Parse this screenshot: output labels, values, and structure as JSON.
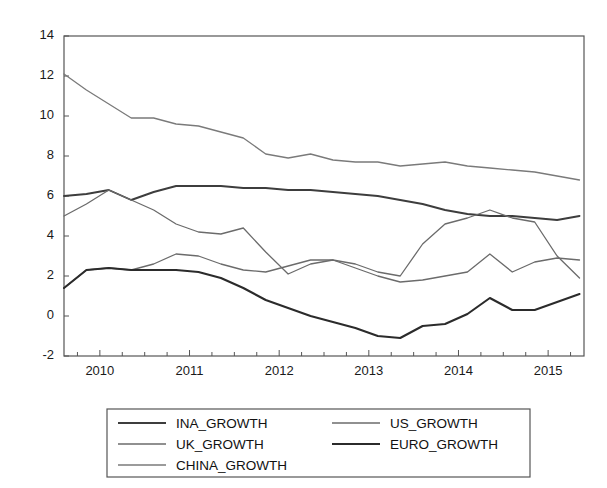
{
  "chart_data": {
    "type": "line",
    "title": "",
    "xlabel": "",
    "ylabel": "",
    "xlim": [
      2009.6,
      2015.4
    ],
    "ylim": [
      -2,
      14
    ],
    "yticks": [
      -2,
      0,
      2,
      4,
      6,
      8,
      10,
      12,
      14
    ],
    "xticks": [
      2010,
      2011,
      2012,
      2013,
      2014,
      2015
    ],
    "x_minor_tick_interval": 0.25,
    "grid": false,
    "legend_position": "below-center",
    "x": [
      2009.6,
      2009.85,
      2010.1,
      2010.35,
      2010.6,
      2010.85,
      2011.1,
      2011.35,
      2011.6,
      2011.85,
      2012.1,
      2012.35,
      2012.6,
      2012.85,
      2013.1,
      2013.35,
      2013.6,
      2013.85,
      2014.1,
      2014.35,
      2014.6,
      2014.85,
      2015.1,
      2015.35
    ],
    "series": [
      {
        "name": "INA_GROWTH",
        "color": "#3d3d3d",
        "width": 1.9,
        "values": [
          6.0,
          6.1,
          6.3,
          5.8,
          6.2,
          6.5,
          6.5,
          6.5,
          6.4,
          6.4,
          6.3,
          6.3,
          6.2,
          6.1,
          6.0,
          5.8,
          5.6,
          5.3,
          5.1,
          5.0,
          5.0,
          4.9,
          4.8,
          5.0
        ]
      },
      {
        "name": "US_GROWTH",
        "color": "#6b6b6b",
        "width": 1.3,
        "values": [
          1.4,
          2.3,
          2.4,
          2.3,
          2.6,
          3.1,
          3.0,
          2.6,
          2.3,
          2.2,
          2.5,
          2.8,
          2.8,
          2.4,
          2.0,
          1.7,
          1.8,
          2.0,
          2.2,
          3.1,
          2.2,
          2.7,
          2.9,
          2.8
        ]
      },
      {
        "name": "UK_GROWTH",
        "color": "#6b6b6b",
        "width": 1.3,
        "values": [
          5.0,
          5.6,
          6.3,
          5.8,
          5.3,
          4.6,
          4.2,
          4.1,
          4.4,
          3.2,
          2.1,
          2.6,
          2.8,
          2.6,
          2.2,
          2.0,
          3.6,
          4.6,
          4.9,
          5.3,
          4.9,
          4.7,
          3.0,
          1.9
        ]
      },
      {
        "name": "EURO_GROWTH",
        "color": "#2b2b2b",
        "width": 2.1,
        "values": [
          1.4,
          2.3,
          2.4,
          2.3,
          2.3,
          2.3,
          2.2,
          1.9,
          1.4,
          0.8,
          0.4,
          0.0,
          -0.3,
          -0.6,
          -1.0,
          -1.1,
          -0.5,
          -0.4,
          0.1,
          0.9,
          0.3,
          0.3,
          0.7,
          1.1
        ]
      },
      {
        "name": "CHINA_GROWTH",
        "color": "#7a7a7a",
        "width": 1.3,
        "values": [
          12.1,
          11.3,
          10.6,
          9.9,
          9.9,
          9.6,
          9.5,
          9.2,
          8.9,
          8.1,
          7.9,
          8.1,
          7.8,
          7.7,
          7.7,
          7.5,
          7.6,
          7.7,
          7.5,
          7.4,
          7.3,
          7.2,
          7.0,
          6.8
        ]
      }
    ]
  },
  "legend": {
    "entries": [
      {
        "label": "INA_GROWTH"
      },
      {
        "label": "US_GROWTH"
      },
      {
        "label": "UK_GROWTH"
      },
      {
        "label": "EURO_GROWTH"
      },
      {
        "label": "CHINA_GROWTH"
      }
    ]
  }
}
